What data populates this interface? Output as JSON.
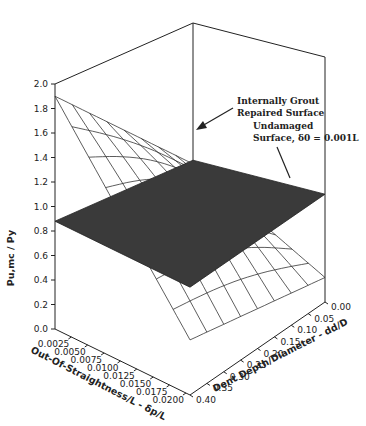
{
  "chart_data": {
    "type": "surface3d",
    "title": "",
    "zlabel": "Pu,mc / Py",
    "xlabel": "Out-Of-Straightness/L - δp/L",
    "ylabel": "Dent Depth/Diameter - dd/D",
    "z_ticks": [
      "0.0",
      "0.2",
      "0.4",
      "0.6",
      "0.8",
      "1.0",
      "1.2",
      "1.4",
      "1.6",
      "1.8",
      "2.0"
    ],
    "x_ticks": [
      "0.0025",
      "0.0050",
      "0.0075",
      "0.0100",
      "0.0125",
      "0.0150",
      "0.0175",
      "0.0200"
    ],
    "y_ticks": [
      "0.00",
      "0.05",
      "0.10",
      "0.15",
      "0.20",
      "0.25",
      "0.30",
      "0.35",
      "0.40"
    ],
    "zlim": [
      0.0,
      2.0
    ],
    "xlim": [
      0.0025,
      0.02
    ],
    "ylim": [
      0.0,
      0.4
    ],
    "series": [
      {
        "name": "Internally Grout Repaired Surface",
        "style": "wireframe",
        "corner_values": {
          "x0.0025_d0.00": 0.85,
          "x0.0025_d0.40": 1.9,
          "x0.0200_d0.00": 0.2,
          "x0.0200_d0.40": 0.45
        }
      },
      {
        "name": "Undamaged Surface, δ0 = 0.001L",
        "style": "shaded-plane",
        "corner_values": {
          "x0.0025_d0.00": 0.88,
          "x0.0025_d0.40": 0.88,
          "x0.0200_d0.00": 0.88,
          "x0.0200_d0.40": 0.88
        }
      }
    ],
    "annotations": [
      "Internally Grout Repaired Surface",
      "Undamaged Surface, δ0 = 0.001L"
    ]
  },
  "labels": {
    "zaxis": "Pu,mc / Py",
    "xaxis": "Out-Of-Straightness/L - δp/L",
    "yaxis": "Dent Depth/Diameter - dd/D",
    "ann1_line1": "Internally Grout",
    "ann1_line2": "Repaired Surface",
    "ann2_line1": "Undamaged",
    "ann2_line2": "Surface, δ0 = 0.001L"
  }
}
